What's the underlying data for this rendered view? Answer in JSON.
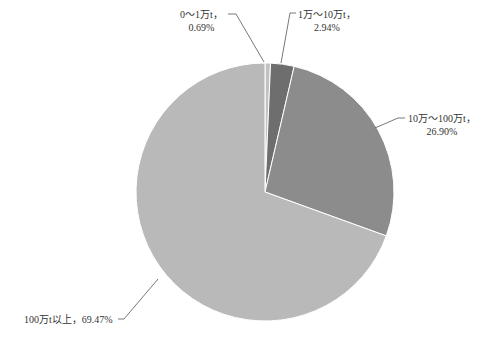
{
  "chart_data": {
    "type": "pie",
    "title": "",
    "categories": [
      "0～1万t",
      "1万～10万t",
      "10万～100万t",
      "100万t以上"
    ],
    "values": [
      0.69,
      2.94,
      26.9,
      69.47
    ],
    "unit": "%",
    "start_angle": "12 o'clock",
    "direction": "clockwise",
    "colors": [
      "#c2c2c2",
      "#6e6e6e",
      "#8c8c8c",
      "#b9b9b9"
    ],
    "legend": "none",
    "label_style": "outside labels with leader lines"
  },
  "labels": [
    {
      "name": "0～1万t，",
      "pct": "0.69%"
    },
    {
      "name": "1万～10万t，",
      "pct": "2.94%"
    },
    {
      "name": "10万～100万t，",
      "pct": "26.90%"
    },
    {
      "name": "100万t以上，69.47%",
      "pct": ""
    }
  ]
}
